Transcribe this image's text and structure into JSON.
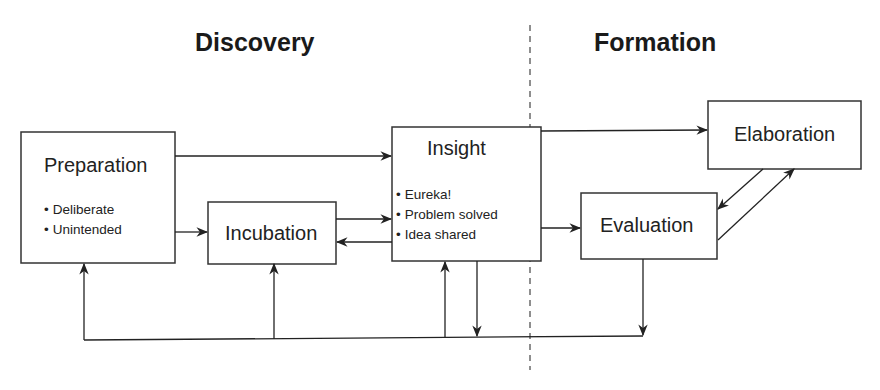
{
  "sections": {
    "left": "Discovery",
    "right": "Formation"
  },
  "nodes": {
    "preparation": {
      "title": "Preparation",
      "bullets": [
        "Deliberate",
        "Unintended"
      ]
    },
    "incubation": {
      "title": "Incubation"
    },
    "insight": {
      "title": "Insight",
      "bullets": [
        "Eureka!",
        "Problem solved",
        "Idea shared"
      ]
    },
    "evaluation": {
      "title": "Evaluation"
    },
    "elaboration": {
      "title": "Elaboration"
    }
  },
  "edges": [
    {
      "from": "Preparation",
      "to": "Insight"
    },
    {
      "from": "Preparation",
      "to": "Incubation"
    },
    {
      "from": "Incubation",
      "to": "Insight"
    },
    {
      "from": "Insight",
      "to": "Incubation"
    },
    {
      "from": "Insight",
      "to": "Elaboration"
    },
    {
      "from": "Insight",
      "to": "Evaluation"
    },
    {
      "from": "Evaluation",
      "to": "Elaboration"
    },
    {
      "from": "Elaboration",
      "to": "Evaluation"
    },
    {
      "from": "Insight",
      "to": "feedback-loop"
    },
    {
      "from": "Evaluation",
      "to": "feedback-loop"
    },
    {
      "from": "feedback-loop",
      "to": "Preparation"
    },
    {
      "from": "feedback-loop",
      "to": "Incubation"
    },
    {
      "from": "feedback-loop",
      "to": "Insight"
    }
  ]
}
